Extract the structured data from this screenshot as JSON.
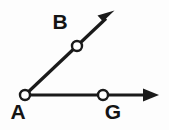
{
  "figure": {
    "type": "geometry-angle-diagram",
    "background_color": "#fdfdfd",
    "stroke_color": "#1a1a1a",
    "point_fill_color": "#ffffff",
    "canvas": {
      "width": 169,
      "height": 130
    }
  },
  "labels": {
    "vertex": "A",
    "upper_ray_point": "B",
    "lower_ray_point": "G"
  },
  "points": [
    {
      "name": "A",
      "role": "vertex",
      "x": 25,
      "y": 95,
      "label_x": 18,
      "label_y": 113,
      "radius": 5
    },
    {
      "name": "B",
      "role": "ray-point",
      "x": 77,
      "y": 46,
      "label_x": 60,
      "label_y": 23,
      "radius": 5
    },
    {
      "name": "G",
      "role": "ray-point",
      "x": 103,
      "y": 95,
      "label_x": 113,
      "label_y": 113,
      "radius": 5
    }
  ],
  "rays": [
    {
      "name": "ray-AB",
      "from": "A",
      "through": "B",
      "start": {
        "x": 25,
        "y": 95
      },
      "end": {
        "x": 113,
        "y": 12
      },
      "arrow": true
    },
    {
      "name": "ray-AG",
      "from": "A",
      "through": "G",
      "start": {
        "x": 25,
        "y": 95
      },
      "end": {
        "x": 158,
        "y": 95
      },
      "arrow": true
    }
  ],
  "geometry": {
    "arrow_ab_tip_x": 113,
    "arrow_ab_tip_y": 12,
    "arrow_ag_tip_x": 158,
    "arrow_ag_tip_y": 95,
    "line_width": 3.2
  }
}
